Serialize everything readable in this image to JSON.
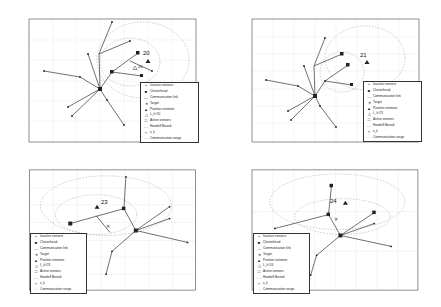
{
  "figure": {
    "panels": [
      {
        "id": "top-left",
        "step_label": "20",
        "estimate_label": "20",
        "cov_label": "L_k^20"
      },
      {
        "id": "top-right",
        "step_label": "21",
        "estimate_label": "21",
        "cov_label": "L_k^21"
      },
      {
        "id": "bottom-left",
        "step_label": "23",
        "estimate_label": "23",
        "cov_label": "L_k^23"
      },
      {
        "id": "bottom-right",
        "step_label": "24",
        "estimate_label": "24",
        "cov_label": "L_k^24"
      }
    ],
    "legend": [
      {
        "symbol": "•",
        "label": "Inactive sensors"
      },
      {
        "symbol": "■",
        "label": "Clusterhead"
      },
      {
        "symbol": "—",
        "label": "Communication link"
      },
      {
        "symbol": "∗",
        "label": "Target"
      },
      {
        "symbol": "▲",
        "label": "Position estimate"
      },
      {
        "symbol": "△",
        "label": "L_k^k"
      },
      {
        "symbol": "□",
        "label": "Active sensors"
      },
      {
        "symbol": "- -",
        "label": "Handoff Bound"
      },
      {
        "symbol": "×",
        "label": "x_k"
      },
      {
        "symbol": "···",
        "label": "Communication range"
      }
    ],
    "colors": {
      "line": "#333333",
      "grid": "#dddddd",
      "dashed": "#888888"
    }
  }
}
